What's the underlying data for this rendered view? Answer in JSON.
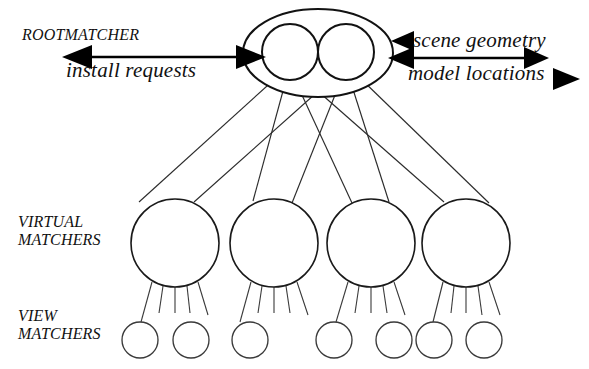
{
  "diagram": {
    "background_color": "#ffffff",
    "stroke_color": "#1a1a1a",
    "width": 589,
    "height": 369,
    "labels": {
      "rootmatcher": "ROOTMATCHER",
      "install_requests": "install requests",
      "scene_geometry": "scene geometry",
      "model_locations": "model locations",
      "virtual_line1": "VIRTUAL",
      "virtual_line2": "MATCHERS",
      "view_line1": "VIEW",
      "view_line2": "MATCHERS"
    },
    "levels": [
      {
        "name": "root-matcher",
        "label": "ROOTMATCHER",
        "node_count": 2
      },
      {
        "name": "virtual-matchers",
        "label": "VIRTUAL MATCHERS",
        "node_count": 4
      },
      {
        "name": "view-matchers",
        "label": "VIEW MATCHERS",
        "node_count": 7
      }
    ],
    "root": {
      "ellipse": {
        "cx": 318,
        "cy": 53,
        "rx": 75,
        "ry": 44
      },
      "inner_nodes": [
        {
          "name": "root-node-left",
          "cx": 290,
          "cy": 52,
          "r": 28
        },
        {
          "name": "root-node-right",
          "cx": 346,
          "cy": 52,
          "r": 28
        }
      ]
    },
    "virtual_nodes": [
      {
        "name": "virtual-matcher-1",
        "cx": 175,
        "cy": 243,
        "r": 44
      },
      {
        "name": "virtual-matcher-2",
        "cx": 274,
        "cy": 243,
        "r": 44
      },
      {
        "name": "virtual-matcher-3",
        "cx": 371,
        "cy": 243,
        "r": 44
      },
      {
        "name": "virtual-matcher-4",
        "cx": 466,
        "cy": 243,
        "r": 44
      }
    ],
    "view_nodes": [
      {
        "name": "view-matcher-1",
        "cx": 140,
        "cy": 340,
        "r": 18
      },
      {
        "name": "view-matcher-2",
        "cx": 191,
        "cy": 340,
        "r": 18
      },
      {
        "name": "view-matcher-3",
        "cx": 250,
        "cy": 340,
        "r": 18
      },
      {
        "name": "view-matcher-4",
        "cx": 334,
        "cy": 340,
        "r": 18
      },
      {
        "name": "view-matcher-5",
        "cx": 394,
        "cy": 340,
        "r": 18
      },
      {
        "name": "view-matcher-6",
        "cx": 434,
        "cy": 340,
        "r": 18
      },
      {
        "name": "view-matcher-7",
        "cx": 484,
        "cy": 340,
        "r": 18
      }
    ],
    "flows": [
      {
        "name": "install-requests-flow",
        "label": "install requests",
        "direction": "bidirectional",
        "side": "left"
      },
      {
        "name": "scene-geometry-flow",
        "label": "scene geometry",
        "direction": "inbound",
        "side": "right"
      },
      {
        "name": "model-locations-flow",
        "label": "model locations",
        "direction": "bidirectional",
        "side": "right"
      }
    ]
  }
}
